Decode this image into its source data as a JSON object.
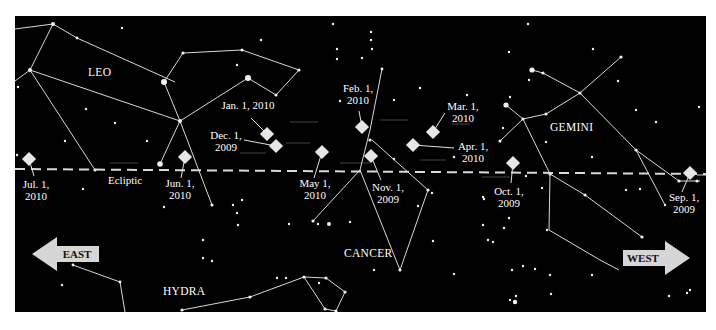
{
  "colors": {
    "sky": "#000000",
    "lines": "#d8d8d8",
    "marker": "#e6e6e6",
    "arrow": "#d6d6d6",
    "motion_hint": "#3a3a3a"
  },
  "sky_rect": {
    "x": 15,
    "y": 16,
    "w": 691,
    "h": 296
  },
  "constellations": [
    {
      "name": "LEO",
      "label_x": 97,
      "label_y": 76
    },
    {
      "name": "GEMINI",
      "label_x": 550,
      "label_y": 131
    },
    {
      "name": "CANCER",
      "label_x": 344,
      "label_y": 257
    },
    {
      "name": "HYDRA",
      "label_x": 163,
      "label_y": 295
    }
  ],
  "ecliptic": {
    "label": "Ecliptic",
    "label_x": 108,
    "label_y": 184,
    "x1": 15,
    "y1": 169,
    "x2": 706,
    "y2": 174
  },
  "directions": {
    "east": {
      "label": "EAST"
    },
    "west": {
      "label": "WEST"
    }
  },
  "positions": [
    {
      "date": "Sep. 1,",
      "year": "2009",
      "x": 690,
      "y": 173,
      "lx": 668,
      "ly": 196,
      "tx": 677,
      "ty": 198
    },
    {
      "date": "Oct. 1,",
      "year": "2009",
      "x": 513,
      "y": 163,
      "lx": 511,
      "ly": 183,
      "tx": 508,
      "ty": 193
    },
    {
      "date": "Nov. 1,",
      "year": "2009",
      "x": 371,
      "y": 156,
      "lx": 381,
      "ly": 178,
      "tx": 387,
      "ty": 191
    },
    {
      "date": "Dec. 1,",
      "year": "2009",
      "x": 276,
      "y": 146,
      "lx": 244,
      "ly": 140,
      "tx": 226,
      "ty": 139
    },
    {
      "date": "Jan. 1, 2010",
      "year": "",
      "x": 267,
      "y": 134,
      "lx": 252,
      "ly": 120,
      "tx": 248,
      "ty": 109
    },
    {
      "date": "Feb. 1,",
      "year": "2010",
      "x": 362,
      "y": 127,
      "lx": 359,
      "ly": 112,
      "tx": 358,
      "ty": 98
    },
    {
      "date": "Mar. 1,",
      "year": "2010",
      "x": 433,
      "y": 132,
      "lx": 445,
      "ly": 115,
      "tx": 461,
      "ty": 111
    },
    {
      "date": "Apr. 1,",
      "year": "2010",
      "x": 413,
      "y": 145,
      "lx": 454,
      "ly": 149,
      "tx": 472,
      "ty": 150
    },
    {
      "date": "May 1,",
      "year": "2010",
      "x": 322,
      "y": 152,
      "lx": 314,
      "ly": 178,
      "tx": 315,
      "ty": 188
    },
    {
      "date": "Jun. 1,",
      "year": "2010",
      "x": 185,
      "y": 157,
      "lx": 180,
      "ly": 180,
      "tx": 179,
      "ty": 188
    },
    {
      "date": "Jul. 1,",
      "year": "2010",
      "x": 29,
      "y": 159,
      "lx": 33,
      "ly": 177,
      "tx": 36,
      "ty": 189
    }
  ]
}
